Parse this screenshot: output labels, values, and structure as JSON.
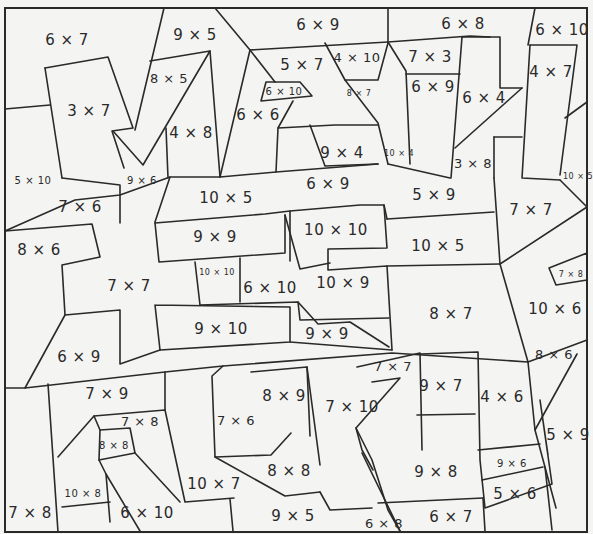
{
  "puzzle": {
    "type": "multiplication color-by-number",
    "operator_symbol": "×",
    "line_color": "#2a2a2a",
    "paper_color": "#f4f4f2",
    "regions": [
      {
        "label": "6 × 7",
        "x": 67,
        "y": 40,
        "size": "l"
      },
      {
        "label": "9 × 5",
        "x": 195,
        "y": 35,
        "size": "l"
      },
      {
        "label": "6 × 9",
        "x": 318,
        "y": 25,
        "size": "l"
      },
      {
        "label": "6 × 8",
        "x": 463,
        "y": 24,
        "size": "l"
      },
      {
        "label": "6 × 10",
        "x": 562,
        "y": 30,
        "size": "l"
      },
      {
        "label": "8 × 5",
        "x": 169,
        "y": 78,
        "size": "m"
      },
      {
        "label": "5 × 7",
        "x": 302,
        "y": 65,
        "size": "l"
      },
      {
        "label": "4 × 10",
        "x": 357,
        "y": 57,
        "size": "m"
      },
      {
        "label": "7 × 3",
        "x": 430,
        "y": 57,
        "size": "l"
      },
      {
        "label": "4 × 7",
        "x": 551,
        "y": 72,
        "size": "l"
      },
      {
        "label": "6 × 10",
        "x": 284,
        "y": 92,
        "size": "s"
      },
      {
        "label": "8 × 7",
        "x": 359,
        "y": 94,
        "size": "xs"
      },
      {
        "label": "6 × 9",
        "x": 433,
        "y": 87,
        "size": "l"
      },
      {
        "label": "6 × 4",
        "x": 484,
        "y": 98,
        "size": "l"
      },
      {
        "label": "3 × 7",
        "x": 89,
        "y": 111,
        "size": "l"
      },
      {
        "label": "6 × 6",
        "x": 258,
        "y": 115,
        "size": "l"
      },
      {
        "label": "4 × 8",
        "x": 191,
        "y": 133,
        "size": "l"
      },
      {
        "label": "9 × 4",
        "x": 342,
        "y": 153,
        "size": "l"
      },
      {
        "label": "10 × 4",
        "x": 399,
        "y": 154,
        "size": "xs"
      },
      {
        "label": "3 × 8",
        "x": 473,
        "y": 163,
        "size": "m"
      },
      {
        "label": "5 × 10",
        "x": 33,
        "y": 181,
        "size": "s"
      },
      {
        "label": "9 × 6",
        "x": 142,
        "y": 181,
        "size": "s"
      },
      {
        "label": "6 × 9",
        "x": 328,
        "y": 184,
        "size": "l"
      },
      {
        "label": "10 × 5",
        "x": 578,
        "y": 177,
        "size": "xs"
      },
      {
        "label": "5 × 9",
        "x": 434,
        "y": 195,
        "size": "l"
      },
      {
        "label": "10 × 5",
        "x": 226,
        "y": 198,
        "size": "l"
      },
      {
        "label": "7 × 6",
        "x": 80,
        "y": 207,
        "size": "l"
      },
      {
        "label": "7 × 7",
        "x": 531,
        "y": 210,
        "size": "l"
      },
      {
        "label": "10 × 10",
        "x": 336,
        "y": 230,
        "size": "l"
      },
      {
        "label": "9 × 9",
        "x": 215,
        "y": 237,
        "size": "l"
      },
      {
        "label": "8 × 6",
        "x": 39,
        "y": 250,
        "size": "l"
      },
      {
        "label": "10 × 5",
        "x": 438,
        "y": 246,
        "size": "l"
      },
      {
        "label": "10 × 10",
        "x": 217,
        "y": 273,
        "size": "xs"
      },
      {
        "label": "7 × 8",
        "x": 571,
        "y": 275,
        "size": "xs"
      },
      {
        "label": "7 × 7",
        "x": 129,
        "y": 286,
        "size": "l"
      },
      {
        "label": "6 × 10",
        "x": 270,
        "y": 288,
        "size": "l"
      },
      {
        "label": "10 × 9",
        "x": 343,
        "y": 283,
        "size": "l"
      },
      {
        "label": "10 × 6",
        "x": 555,
        "y": 309,
        "size": "l"
      },
      {
        "label": "8 × 7",
        "x": 451,
        "y": 314,
        "size": "l"
      },
      {
        "label": "9 × 10",
        "x": 221,
        "y": 329,
        "size": "l"
      },
      {
        "label": "9 × 9",
        "x": 327,
        "y": 334,
        "size": "l"
      },
      {
        "label": "6 × 9",
        "x": 79,
        "y": 357,
        "size": "l"
      },
      {
        "label": "8 × 6",
        "x": 554,
        "y": 354,
        "size": "m"
      },
      {
        "label": "7 × 7",
        "x": 393,
        "y": 366,
        "size": "m"
      },
      {
        "label": "9 × 7",
        "x": 441,
        "y": 386,
        "size": "l"
      },
      {
        "label": "7 × 9",
        "x": 107,
        "y": 394,
        "size": "l"
      },
      {
        "label": "8 × 9",
        "x": 284,
        "y": 396,
        "size": "l"
      },
      {
        "label": "4 × 6",
        "x": 502,
        "y": 397,
        "size": "l"
      },
      {
        "label": "7 × 10",
        "x": 352,
        "y": 407,
        "size": "l"
      },
      {
        "label": "7 × 8",
        "x": 140,
        "y": 421,
        "size": "m"
      },
      {
        "label": "7 × 6",
        "x": 236,
        "y": 420,
        "size": "m"
      },
      {
        "label": "5 × 9",
        "x": 568,
        "y": 435,
        "size": "l"
      },
      {
        "label": "8 × 8",
        "x": 114,
        "y": 446,
        "size": "s"
      },
      {
        "label": "8 × 8",
        "x": 289,
        "y": 471,
        "size": "l"
      },
      {
        "label": "9 × 8",
        "x": 436,
        "y": 472,
        "size": "l"
      },
      {
        "label": "9 × 6",
        "x": 512,
        "y": 464,
        "size": "s"
      },
      {
        "label": "10 × 7",
        "x": 214,
        "y": 484,
        "size": "l"
      },
      {
        "label": "10 × 8",
        "x": 83,
        "y": 494,
        "size": "s"
      },
      {
        "label": "5 × 6",
        "x": 515,
        "y": 494,
        "size": "l"
      },
      {
        "label": "7 × 8",
        "x": 30,
        "y": 513,
        "size": "l"
      },
      {
        "label": "6 × 10",
        "x": 147,
        "y": 513,
        "size": "l"
      },
      {
        "label": "9 × 5",
        "x": 293,
        "y": 516,
        "size": "l"
      },
      {
        "label": "6 × 8",
        "x": 384,
        "y": 523,
        "size": "m"
      },
      {
        "label": "6 × 7",
        "x": 451,
        "y": 517,
        "size": "l"
      }
    ]
  }
}
